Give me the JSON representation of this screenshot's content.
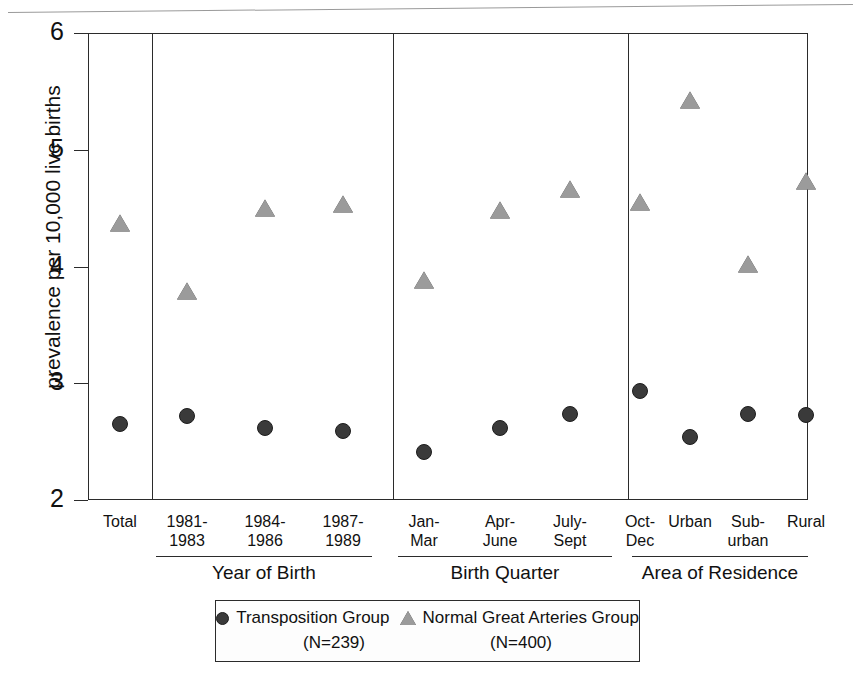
{
  "figure": {
    "y_axis_title": "prevalence per 10,000 live births",
    "y_ticks": [
      "6",
      "5",
      "4",
      "3",
      "2"
    ]
  },
  "legend": {
    "entries": [
      {
        "label": "Transposition Group",
        "n": "(N=239)",
        "marker": "circle-marker-icon",
        "color": "#3a3a3a"
      },
      {
        "label": "Normal Great Arteries Group",
        "n": "(N=400)",
        "marker": "triangle-marker-icon",
        "color": "#9b9b9b"
      }
    ]
  },
  "chart_data": {
    "type": "scatter",
    "title": "",
    "xlabel": "",
    "ylabel": "prevalence per 10,000 live births",
    "ylim": [
      2,
      6
    ],
    "yticks": [
      2,
      3,
      4,
      5,
      6
    ],
    "grid": false,
    "legend_position": "bottom",
    "panels": [
      {
        "name": "total",
        "group_label": "",
        "categories": [
          "Total"
        ]
      },
      {
        "name": "year-of-birth",
        "group_label": "Year of Birth",
        "categories": [
          "1981-\n1983",
          "1984-\n1986",
          "1987-\n1989"
        ]
      },
      {
        "name": "birth-quarter",
        "group_label": "Birth Quarter",
        "categories": [
          "Jan-\nMar",
          "Apr-\nJune",
          "July-\nSept",
          "Oct-\nDec"
        ]
      },
      {
        "name": "area-of-residence",
        "group_label": "Area of Residence",
        "categories": [
          "Urban",
          "Sub-\nurban",
          "Rural"
        ]
      }
    ],
    "categories": [
      "Total",
      "1981-1983",
      "1984-1986",
      "1987-1989",
      "Jan-Mar",
      "Apr-June",
      "July-Sept",
      "Oct-Dec",
      "Urban",
      "Sub-urban",
      "Rural"
    ],
    "series": [
      {
        "name": "Transposition Group",
        "marker": "circle",
        "color": "#3a3a3a",
        "values": [
          2.65,
          2.72,
          2.62,
          2.59,
          2.41,
          2.62,
          2.74,
          2.93,
          2.54,
          2.74,
          2.73
        ]
      },
      {
        "name": "Normal Great Arteries Group",
        "marker": "triangle",
        "color": "#9b9b9b",
        "values": [
          4.4,
          3.82,
          4.53,
          4.56,
          3.91,
          4.51,
          4.69,
          4.58,
          5.45,
          4.05,
          4.76
        ]
      }
    ]
  }
}
